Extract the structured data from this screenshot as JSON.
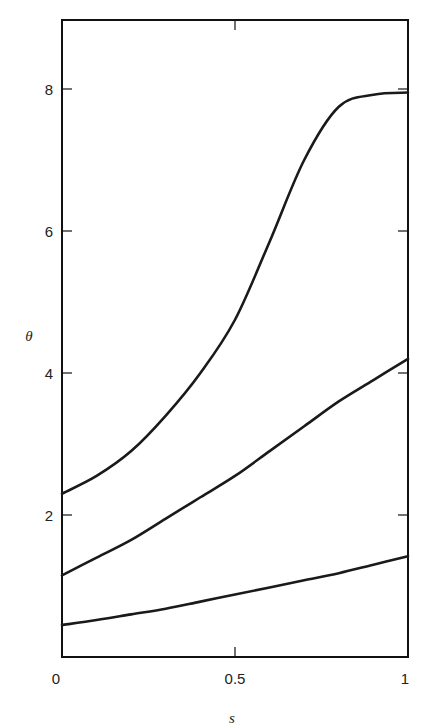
{
  "chart_data": {
    "type": "line",
    "title": "",
    "xlabel": "s",
    "ylabel": "θ",
    "xlim": [
      0,
      1
    ],
    "ylim": [
      0,
      9
    ],
    "grid": false,
    "legend": null,
    "x_ticks": [
      "0",
      "0.5",
      "1"
    ],
    "y_ticks": [
      "2",
      "4",
      "6",
      "8"
    ],
    "x": [
      0,
      0.1,
      0.2,
      0.3,
      0.4,
      0.5,
      0.6,
      0.7,
      0.8,
      0.9,
      1.0
    ],
    "series": [
      {
        "name": "upper",
        "values": [
          2.3,
          2.55,
          2.9,
          3.4,
          4.0,
          4.75,
          5.85,
          7.0,
          7.75,
          7.92,
          7.95
        ]
      },
      {
        "name": "middle",
        "values": [
          1.15,
          1.4,
          1.65,
          1.95,
          2.25,
          2.55,
          2.9,
          3.25,
          3.6,
          3.9,
          4.2
        ]
      },
      {
        "name": "lower",
        "values": [
          0.45,
          0.52,
          0.6,
          0.68,
          0.78,
          0.88,
          0.98,
          1.08,
          1.18,
          1.3,
          1.42
        ]
      }
    ]
  },
  "labels": {
    "xlabel": "s",
    "ylabel": "θ",
    "x_ticks": [
      "0",
      "0.5",
      "1"
    ],
    "y_ticks": [
      "2",
      "4",
      "6",
      "8"
    ]
  }
}
